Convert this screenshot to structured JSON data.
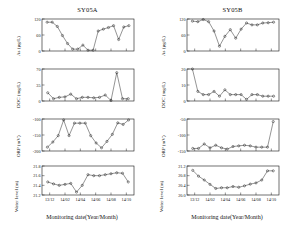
{
  "figure": {
    "columns": [
      {
        "id": "SY05A",
        "title": "SY05A"
      },
      {
        "id": "SY05B",
        "title": "SY05B"
      }
    ],
    "xaxis_title": "Monitoring date(Year/Month)",
    "xticklabels": [
      "13/12",
      "14/02",
      "14/04",
      "14/06",
      "14/08",
      "14/10"
    ],
    "axis_color": "#111111",
    "line_color": "#111111",
    "marker": "open-circle"
  },
  "chart_data": [
    {
      "type": "line",
      "panel": "row1-col1",
      "title": "SY05A",
      "ylabel": "As (µg/L)",
      "xlabel": "Monitoring date(Year/Month)",
      "ylim": [
        0,
        120
      ],
      "yticks": [
        0,
        60,
        120
      ],
      "yticklabels": [
        "0",
        "60",
        "120"
      ],
      "xlim": [
        0,
        17
      ],
      "xticks": [
        2,
        5,
        8,
        11,
        14,
        17
      ],
      "xticklabels": [
        "13/12",
        "14/02",
        "14/04",
        "14/06",
        "14/08",
        "14/10"
      ],
      "grid": false,
      "legend": "none",
      "x": [
        1,
        2,
        3,
        4,
        5,
        6,
        7,
        8,
        9,
        10,
        11,
        12,
        13,
        14,
        15,
        16
      ],
      "values": [
        108,
        108,
        92,
        58,
        28,
        7,
        7,
        22,
        3,
        3,
        75,
        82,
        88,
        95,
        43,
        90,
        95
      ]
    },
    {
      "type": "line",
      "panel": "row1-col2",
      "title": "SY05B",
      "ylabel": "As (µg/L)",
      "xlabel": "Monitoring date(Year/Month)",
      "ylim": [
        0,
        120
      ],
      "yticks": [
        0,
        60,
        120
      ],
      "yticklabels": [
        "0",
        "60",
        "120"
      ],
      "grid": false,
      "legend": "none",
      "values": [
        112,
        110,
        118,
        110,
        75,
        18,
        55,
        80,
        48,
        82,
        105,
        98,
        98,
        105,
        106,
        108
      ]
    },
    {
      "type": "line",
      "panel": "row2-col1",
      "ylabel": "DOC (mg/L)",
      "xlabel": "Monitoring date(Year/Month)",
      "ylim": [
        0,
        70
      ],
      "yticks": [
        0,
        35,
        70
      ],
      "yticklabels": [
        "0",
        "35",
        "70"
      ],
      "grid": false,
      "legend": "none",
      "values": [
        18,
        5,
        8,
        9,
        15,
        5,
        8,
        8,
        7,
        8,
        13,
        1,
        62,
        5,
        5
      ]
    },
    {
      "type": "line",
      "panel": "row2-col2",
      "ylabel": "DOC (mg/L)",
      "xlabel": "Monitoring date(Year/Month)",
      "ylim": [
        0,
        20
      ],
      "yticks": [
        0,
        10,
        20
      ],
      "yticklabels": [
        "0",
        "10",
        "20"
      ],
      "grid": false,
      "legend": "none",
      "values": [
        20,
        6,
        4,
        4,
        6,
        3,
        7,
        4,
        4,
        4,
        1,
        4,
        4,
        3,
        3,
        3
      ]
    },
    {
      "type": "line",
      "panel": "row3-col1",
      "ylabel": "ORP (mV)",
      "xlabel": "Monitoring date(Year/Month)",
      "ylim": [
        -200,
        -100
      ],
      "yticks": [
        -200,
        -150,
        -100
      ],
      "yticklabels": [
        "-200",
        "-150",
        "-100"
      ],
      "grid": false,
      "legend": "none",
      "values": [
        -188,
        -172,
        -152,
        -103,
        -152,
        -113,
        -113,
        -113,
        -152,
        -175,
        -190,
        -170,
        -148,
        -112,
        -117,
        -103
      ]
    },
    {
      "type": "line",
      "panel": "row3-col2",
      "ylabel": "ORP (mV)",
      "xlabel": "Monitoring date(Year/Month)",
      "ylim": [
        -150,
        -50
      ],
      "yticks": [
        -150,
        -100,
        -50
      ],
      "yticklabels": [
        "-150",
        "-100",
        "-50"
      ],
      "grid": false,
      "legend": "none",
      "values": [
        -142,
        -142,
        -128,
        -140,
        -132,
        -140,
        -144,
        -136,
        -134,
        -132,
        -134,
        -138,
        -138,
        -138,
        -58
      ]
    },
    {
      "type": "line",
      "panel": "row4-col1",
      "ylabel": "Water level (m)",
      "xlabel": "Monitoring date(Year/Month)",
      "ylim": [
        21.2,
        21.8
      ],
      "yticks": [
        21.2,
        21.4,
        21.6,
        21.8
      ],
      "yticklabels": [
        "21.2",
        "21.4",
        "21.6",
        "21.8"
      ],
      "grid": false,
      "legend": "none",
      "values": [
        21.47,
        21.43,
        21.4,
        21.42,
        21.44,
        21.26,
        21.4,
        21.62,
        21.6,
        21.6,
        21.62,
        21.64,
        21.66,
        21.65,
        21.47
      ]
    },
    {
      "type": "line",
      "panel": "row4-col2",
      "ylabel": "Water level (m)",
      "xlabel": "Monitoring date(Year/Month)",
      "ylim": [
        20.0,
        21.2
      ],
      "yticks": [
        20.0,
        20.4,
        20.8,
        21.2
      ],
      "yticklabels": [
        "20.0",
        "20.4",
        "20.8",
        "21.2"
      ],
      "grid": false,
      "legend": "none",
      "values": [
        21.02,
        20.78,
        20.62,
        20.44,
        20.27,
        20.3,
        20.3,
        20.35,
        20.32,
        20.38,
        20.45,
        20.5,
        20.62,
        21.0,
        21.0
      ]
    }
  ]
}
